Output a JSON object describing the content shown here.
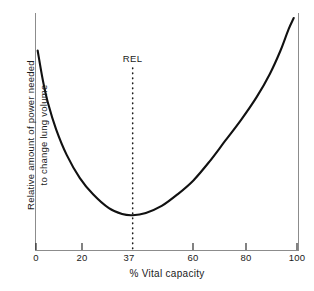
{
  "chart_data": {
    "type": "line",
    "title": "",
    "xlabel": "% Vital capacity",
    "ylabel_line1": "Relative amount of power needed",
    "ylabel_line2": "to change lung volume",
    "xlim": [
      0,
      100
    ],
    "ylim": [
      0,
      1
    ],
    "grid": false,
    "legend": "none",
    "xticks": [
      {
        "value": 0,
        "label": "0"
      },
      {
        "value": 20,
        "label": "20"
      },
      {
        "value": 37,
        "label": "37"
      },
      {
        "value": 60,
        "label": "60"
      },
      {
        "value": 80,
        "label": "80"
      },
      {
        "value": 100,
        "label": "100"
      }
    ],
    "yticks": [],
    "annotations": [
      {
        "text": "REL",
        "x": 37,
        "style": "dotted-vertical-line"
      }
    ],
    "series": [
      {
        "name": "Relative power needed to change lung volume",
        "color": "#111111",
        "x": [
          1,
          3,
          5,
          8,
          12,
          17,
          22,
          28,
          33,
          37,
          42,
          48,
          54,
          60,
          66,
          72,
          78,
          84,
          89,
          93,
          96,
          98
        ],
        "y": [
          0.86,
          0.73,
          0.63,
          0.52,
          0.41,
          0.31,
          0.24,
          0.18,
          0.155,
          0.15,
          0.16,
          0.19,
          0.24,
          0.3,
          0.38,
          0.47,
          0.56,
          0.66,
          0.76,
          0.86,
          0.95,
          1.0
        ]
      }
    ]
  },
  "axis_colors": {
    "frame": "#8c8c8c",
    "curve": "#111111",
    "text": "#1a1a1a",
    "background": "#ffffff"
  }
}
